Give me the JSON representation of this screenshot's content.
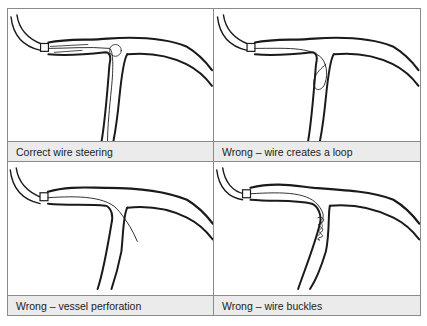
{
  "figure": {
    "panels": [
      {
        "id": "correct-steering",
        "caption": "Correct wire steering",
        "wire_state": "correct"
      },
      {
        "id": "wire-loop",
        "caption": "Wrong – wire creates a loop",
        "wire_state": "loop"
      },
      {
        "id": "vessel-perforation",
        "caption": "Wrong – vessel perforation",
        "wire_state": "perforation"
      },
      {
        "id": "wire-buckles",
        "caption": "Wrong – wire buckles",
        "wire_state": "buckle"
      }
    ],
    "colors": {
      "border": "#8a8a8a",
      "caption_bg": "#ebebeb",
      "ink": "#1a1a1a"
    }
  }
}
